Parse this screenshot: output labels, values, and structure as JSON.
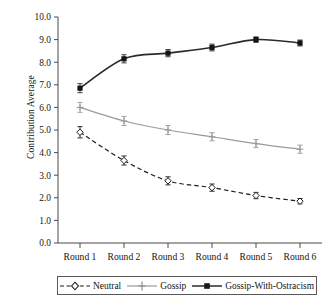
{
  "chart_data": {
    "type": "line",
    "title": "",
    "xlabel": "",
    "ylabel": "Contribution Average",
    "categories": [
      "Round 1",
      "Round 2",
      "Round 3",
      "Round 4",
      "Round 5",
      "Round 6"
    ],
    "ylim": [
      0.0,
      10.0
    ],
    "ytick_labels": [
      "10.0",
      "9.0",
      "8.0",
      "7.0",
      "6.0",
      "5.0",
      "4.0",
      "3.0",
      "2.0",
      "1.0",
      "0.0"
    ],
    "ytick_values": [
      10.0,
      9.0,
      8.0,
      7.0,
      6.0,
      5.0,
      4.0,
      3.0,
      2.0,
      1.0,
      0.0
    ],
    "grid": false,
    "legend_position": "bottom",
    "series": [
      {
        "name": "Neutral",
        "values": [
          4.9,
          3.65,
          2.75,
          2.45,
          2.1,
          1.85
        ],
        "errors": [
          0.25,
          0.2,
          0.18,
          0.16,
          0.14,
          0.12
        ],
        "color": "#1c1c1c",
        "line_style": "dashed",
        "marker": "open-diamond"
      },
      {
        "name": "Gossip",
        "values": [
          6.0,
          5.4,
          5.0,
          4.7,
          4.4,
          4.15
        ],
        "errors": [
          0.22,
          0.2,
          0.2,
          0.18,
          0.18,
          0.18
        ],
        "color": "#9a9a9a",
        "line_style": "solid",
        "marker": "plus"
      },
      {
        "name": "Gossip-With-Ostracism",
        "values": [
          6.85,
          8.15,
          8.4,
          8.65,
          9.0,
          8.85
        ],
        "errors": [
          0.2,
          0.18,
          0.16,
          0.15,
          0.12,
          0.13
        ],
        "color": "#2b2b2b",
        "line_style": "solid",
        "marker": "filled-square"
      }
    ]
  },
  "legend": {
    "items": [
      {
        "label": "Neutral"
      },
      {
        "label": "Gossip"
      },
      {
        "label": "Gossip-With-Ostracism"
      }
    ]
  }
}
